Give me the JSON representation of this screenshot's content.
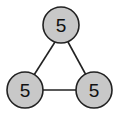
{
  "diagram": {
    "type": "graph",
    "style": {
      "node_fill": "#c8c8c8",
      "node_stroke": "#222222",
      "edge_color": "#222222",
      "background": "#ffffff"
    },
    "nodes": [
      {
        "id": "top",
        "label": "5",
        "cx": 61,
        "cy": 25,
        "r": 18
      },
      {
        "id": "bottom-left",
        "label": "5",
        "cx": 25,
        "cy": 90,
        "r": 18
      },
      {
        "id": "bottom-right",
        "label": "5",
        "cx": 94,
        "cy": 90,
        "r": 18
      }
    ],
    "edges": [
      {
        "from": "top",
        "to": "bottom-left"
      },
      {
        "from": "top",
        "to": "bottom-right"
      },
      {
        "from": "bottom-left",
        "to": "bottom-right"
      }
    ]
  }
}
